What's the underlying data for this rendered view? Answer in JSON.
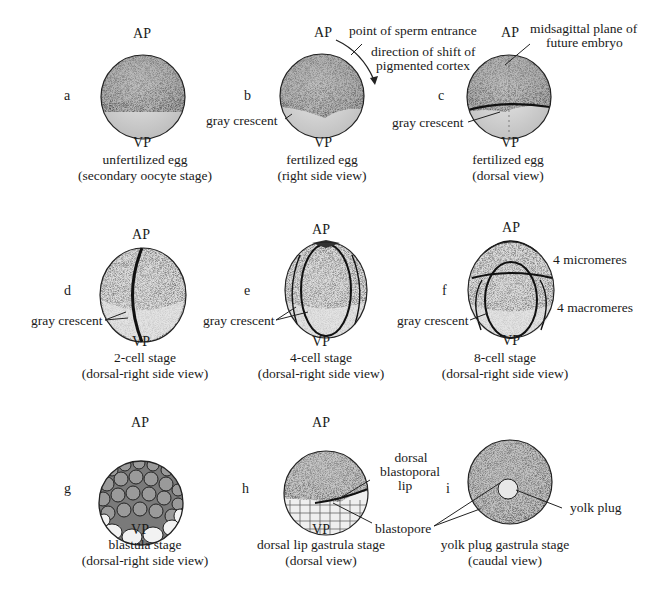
{
  "poles": {
    "animal": "AP",
    "vegetal": "VP"
  },
  "panels": [
    {
      "id": "a",
      "letter": "a",
      "caption": [
        "unfertilized egg",
        "(secondary oocyte stage)"
      ],
      "labels": []
    },
    {
      "id": "b",
      "letter": "b",
      "caption": [
        "fertilized egg",
        "(right side view)"
      ],
      "labels": [
        "point of sperm  entrance",
        "direction of shift of",
        "pigmented cortex",
        "gray crescent"
      ]
    },
    {
      "id": "c",
      "letter": "c",
      "caption": [
        "fertilized egg",
        "(dorsal view)"
      ],
      "labels": [
        "midsagittal plane of",
        "future embryo",
        "gray crescent"
      ]
    },
    {
      "id": "d",
      "letter": "d",
      "caption": [
        "2-cell stage",
        "(dorsal-right side view)"
      ],
      "labels": [
        "gray crescent"
      ]
    },
    {
      "id": "e",
      "letter": "e",
      "caption": [
        "4-cell stage",
        "(dorsal-right side view)"
      ],
      "labels": [
        "gray crescent"
      ]
    },
    {
      "id": "f",
      "letter": "f",
      "caption": [
        "8-cell stage",
        "(dorsal-right side view)"
      ],
      "labels": [
        "4 micromeres",
        "4 macromeres",
        "gray crescent"
      ]
    },
    {
      "id": "g",
      "letter": "g",
      "caption": [
        "blastula stage",
        "(dorsal-right side view)"
      ],
      "labels": []
    },
    {
      "id": "h",
      "letter": "h",
      "caption": [
        "dorsal lip gastrula stage",
        "(dorsal view)"
      ],
      "labels": [
        "dorsal",
        "blastoporal",
        "lip",
        "blastopore"
      ]
    },
    {
      "id": "i",
      "letter": "i",
      "caption": [
        "yolk plug gastrula stage",
        "(caudal view)"
      ],
      "labels": [
        "yolk plug"
      ]
    }
  ],
  "colors": {
    "ink": "#1a1a1a",
    "pigment": "#6e6e6e",
    "yolk": "#ededed",
    "background": "#ffffff"
  }
}
